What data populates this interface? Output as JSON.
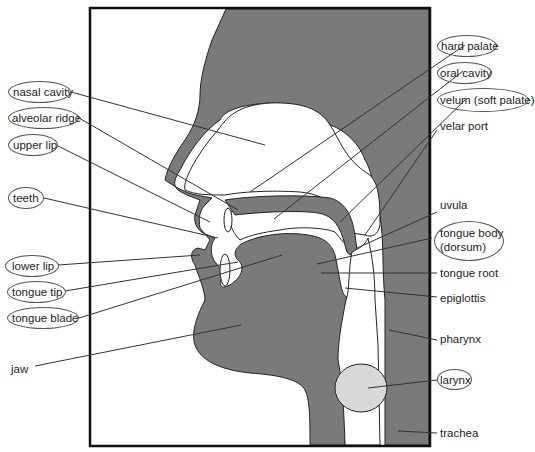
{
  "figure": {
    "frame": {
      "x": 90,
      "y": 8,
      "w": 340,
      "h": 438
    },
    "colors": {
      "tissue": "#7a7a7a",
      "cavity": "#ffffff",
      "larynx": "#d8d8d8",
      "outline": "#222222",
      "frame": "#111111",
      "line": "#333333"
    },
    "labels_left": [
      {
        "text": "nasal cavity",
        "circled": true
      },
      {
        "text": "alveolar ridge",
        "circled": true
      },
      {
        "text": "upper lip",
        "circled": true
      },
      {
        "text": "teeth",
        "circled": true
      },
      {
        "text": "lower lip",
        "circled": true
      },
      {
        "text": "tongue tip",
        "circled": true
      },
      {
        "text": "tongue blade",
        "circled": true
      },
      {
        "text": "jaw",
        "circled": false
      }
    ],
    "labels_right": [
      {
        "text": "hard palate",
        "circled": true
      },
      {
        "text": "oral cavity",
        "circled": true
      },
      {
        "text": "velum (soft palate)",
        "circled": true
      },
      {
        "text": "velar port",
        "circled": false
      },
      {
        "text": "uvula",
        "circled": false
      },
      {
        "text": "tongue body",
        "text2": "(dorsum)",
        "circled": true
      },
      {
        "text": "tongue root",
        "circled": false
      },
      {
        "text": "epiglottis",
        "circled": false
      },
      {
        "text": "pharynx",
        "circled": false
      },
      {
        "text": "larynx",
        "circled": true
      },
      {
        "text": "trachea",
        "circled": false
      }
    ]
  }
}
